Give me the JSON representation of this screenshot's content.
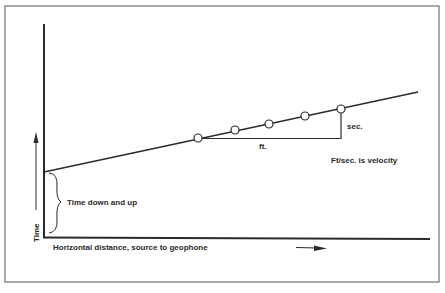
{
  "diagram": {
    "type": "seismic-refraction-time-distance",
    "labels": {
      "y_axis": "Time",
      "x_axis": "Horizontal distance, source to geophone",
      "intercept": "Time down and up",
      "rise": "sec.",
      "run": "ft.",
      "note": "Ft/sec. is velocity"
    },
    "geophone_points": [
      {
        "x": 198,
        "y": 138
      },
      {
        "x": 235,
        "y": 130
      },
      {
        "x": 269,
        "y": 124
      },
      {
        "x": 305,
        "y": 116
      },
      {
        "x": 341,
        "y": 109
      }
    ],
    "colors": {
      "ink": "#2a2a2a",
      "frame": "#555555",
      "background": "#ffffff"
    }
  }
}
